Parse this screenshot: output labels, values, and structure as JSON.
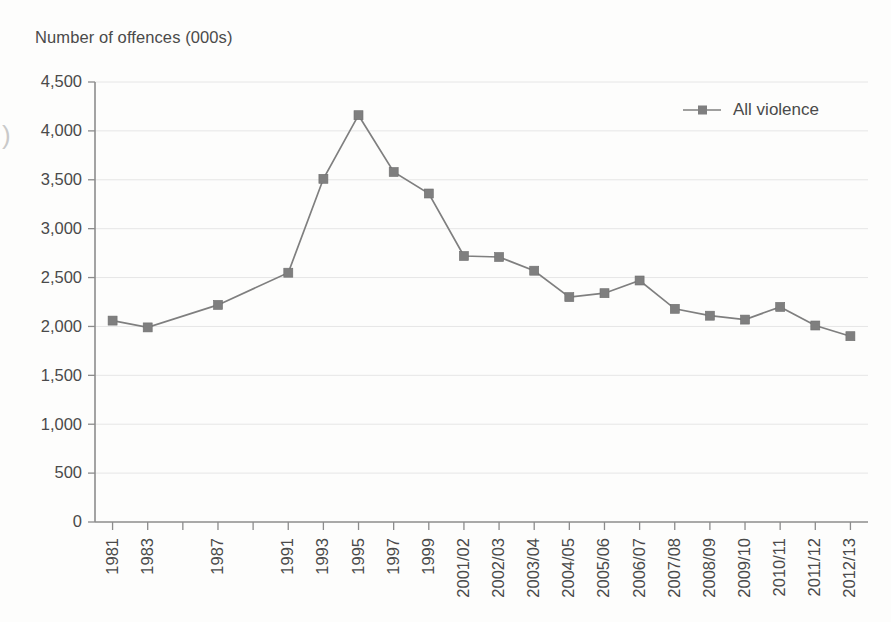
{
  "figure": {
    "y_axis_title": "Number of offences (000s)",
    "edge_artifact_glyph": ")"
  },
  "legend": {
    "position": "top-right",
    "entries": [
      {
        "label": "All violence",
        "color": "#7f7f7f",
        "marker": "square"
      }
    ]
  },
  "colors": {
    "series": "#7f7f7f",
    "gridline": "#e6e6e6",
    "axis": "#8c8c8c",
    "text": "#4a4a4a",
    "background": "#fdfdfc"
  },
  "chart_data": {
    "type": "line",
    "title": "",
    "subtitle": "",
    "xlabel": "",
    "ylabel": "Number of offences (000s)",
    "ylim": [
      0,
      4500
    ],
    "ytick_values": [
      0,
      500,
      1000,
      1500,
      2000,
      2500,
      3000,
      3500,
      4000,
      4500
    ],
    "ytick_labels": [
      "0",
      "500",
      "1,000",
      "1,500",
      "2,000",
      "2,500",
      "3,000",
      "3,500",
      "4,000",
      "4,500"
    ],
    "grid": true,
    "grid_axis": "y",
    "legend_position": "top-right",
    "categories": [
      "1981",
      "1983",
      "1985",
      "1987",
      "1989",
      "1991",
      "1993",
      "1995",
      "1997",
      "1999",
      "2001/02",
      "2002/03",
      "2003/04",
      "2004/05",
      "2005/06",
      "2006/07",
      "2007/08",
      "2008/09",
      "2009/10",
      "2010/11",
      "2011/12",
      "2012/13"
    ],
    "xtick_labels": [
      "1981",
      "1983",
      "",
      "1987",
      "",
      "1991",
      "1993",
      "1995",
      "1997",
      "1999",
      "2001/02",
      "2002/03",
      "2003/04",
      "2004/05",
      "2005/06",
      "2006/07",
      "2007/08",
      "2008/09",
      "2009/10",
      "2010/11",
      "2011/12",
      "2012/13"
    ],
    "series": [
      {
        "name": "All violence",
        "color": "#7f7f7f",
        "marker": "square",
        "values": [
          2060,
          1990,
          null,
          2220,
          null,
          2550,
          3510,
          4160,
          3580,
          3360,
          2720,
          2710,
          2570,
          2300,
          2340,
          2470,
          2180,
          2110,
          2070,
          2200,
          2010,
          1900
        ]
      }
    ]
  }
}
